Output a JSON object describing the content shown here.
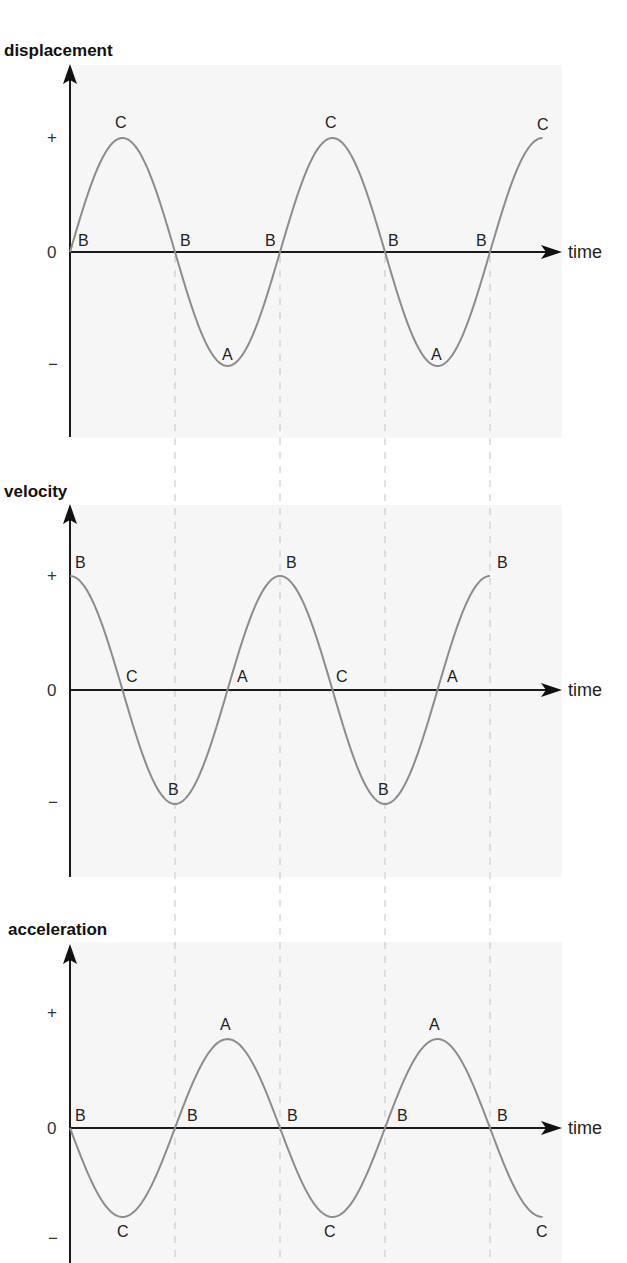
{
  "figure": {
    "colors": {
      "panel_background": "#f6f6f6",
      "curve": "#8c8c8c",
      "axis": "#1a1a1a",
      "guide_lines": "#c4c4c4"
    },
    "time_axis_label": "time",
    "tick_labels": {
      "plus": "+",
      "zero": "0",
      "minus": "−"
    }
  },
  "chart_data": [
    {
      "type": "line",
      "title": "displacement",
      "xlabel": "time",
      "ylabel": "displacement",
      "y_ticks": [
        "+",
        "0",
        "−"
      ],
      "function": "sin",
      "periods_shown": 2.25,
      "amplitude_relative": 1.0,
      "x_phase": [
        0,
        0.25,
        0.5,
        0.75,
        1.0,
        1.25,
        1.5,
        1.75,
        2.0,
        2.25
      ],
      "y": [
        0,
        1,
        0,
        -1,
        0,
        1,
        0,
        -1,
        0,
        1
      ],
      "point_labels": [
        "B",
        "C",
        "B",
        "A",
        "B",
        "C",
        "B",
        "A",
        "B",
        "C"
      ],
      "grid": false
    },
    {
      "type": "line",
      "title": "velocity",
      "xlabel": "time",
      "ylabel": "velocity",
      "y_ticks": [
        "+",
        "0",
        "−"
      ],
      "function": "cos",
      "periods_shown": 2.0,
      "amplitude_relative": 1.0,
      "x_phase": [
        0,
        0.25,
        0.5,
        0.75,
        1.0,
        1.25,
        1.5,
        1.75,
        2.0
      ],
      "y": [
        1,
        0,
        -1,
        0,
        1,
        0,
        -1,
        0,
        1
      ],
      "point_labels": [
        "B",
        "C",
        "B",
        "A",
        "B",
        "C",
        "B",
        "A",
        "B"
      ],
      "grid": false
    },
    {
      "type": "line",
      "title": "acceleration",
      "xlabel": "time",
      "ylabel": "acceleration",
      "y_ticks": [
        "+",
        "0",
        "−"
      ],
      "function": "-sin",
      "periods_shown": 2.25,
      "amplitude_relative": 0.78,
      "x_phase": [
        0,
        0.25,
        0.5,
        0.75,
        1.0,
        1.25,
        1.5,
        1.75,
        2.0,
        2.25
      ],
      "y": [
        0,
        -1,
        0,
        1,
        0,
        -1,
        0,
        1,
        0,
        -1
      ],
      "point_labels": [
        "B",
        "C",
        "B",
        "A",
        "B",
        "C",
        "B",
        "A",
        "B",
        "C"
      ],
      "grid": false
    }
  ],
  "panels": [
    {
      "title": "displacement",
      "labels": [
        {
          "text": "B",
          "x": 78,
          "y": 246
        },
        {
          "text": "C",
          "x": 115,
          "y": 128
        },
        {
          "text": "B",
          "x": 180,
          "y": 246
        },
        {
          "text": "A",
          "x": 222,
          "y": 360
        },
        {
          "text": "B",
          "x": 265,
          "y": 246
        },
        {
          "text": "C",
          "x": 325,
          "y": 128
        },
        {
          "text": "B",
          "x": 388,
          "y": 246
        },
        {
          "text": "A",
          "x": 431,
          "y": 360
        },
        {
          "text": "B",
          "x": 476,
          "y": 246
        },
        {
          "text": "C",
          "x": 537,
          "y": 130
        }
      ]
    },
    {
      "title": "velocity",
      "labels": [
        {
          "text": "B",
          "x": 75,
          "y": 568
        },
        {
          "text": "C",
          "x": 126,
          "y": 682
        },
        {
          "text": "B",
          "x": 168,
          "y": 795
        },
        {
          "text": "A",
          "x": 237,
          "y": 682
        },
        {
          "text": "B",
          "x": 286,
          "y": 568
        },
        {
          "text": "C",
          "x": 336,
          "y": 682
        },
        {
          "text": "B",
          "x": 378,
          "y": 795
        },
        {
          "text": "A",
          "x": 447,
          "y": 682
        },
        {
          "text": "B",
          "x": 497,
          "y": 568
        }
      ]
    },
    {
      "title": "acceleration",
      "labels": [
        {
          "text": "B",
          "x": 75,
          "y": 1121
        },
        {
          "text": "C",
          "x": 117,
          "y": 1237
        },
        {
          "text": "B",
          "x": 187,
          "y": 1121
        },
        {
          "text": "A",
          "x": 220,
          "y": 1030
        },
        {
          "text": "B",
          "x": 287,
          "y": 1121
        },
        {
          "text": "C",
          "x": 324,
          "y": 1237
        },
        {
          "text": "B",
          "x": 397,
          "y": 1121
        },
        {
          "text": "A",
          "x": 429,
          "y": 1030
        },
        {
          "text": "B",
          "x": 497,
          "y": 1121
        },
        {
          "text": "C",
          "x": 536,
          "y": 1237
        }
      ]
    }
  ]
}
